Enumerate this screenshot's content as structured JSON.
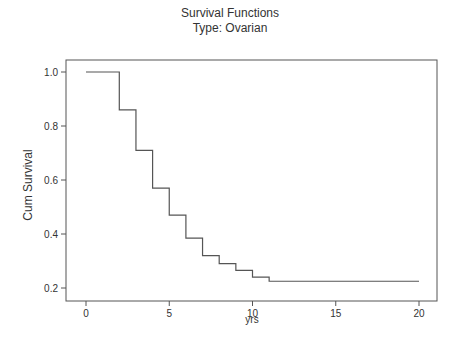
{
  "chart_data": {
    "type": "line",
    "subtype": "step",
    "title": "Survival Functions",
    "subtitle": "Type: Ovarian",
    "xlabel": "yrs",
    "ylabel": "Cum Survival",
    "xlim": [
      -1,
      21
    ],
    "ylim": [
      0.155,
      1.045
    ],
    "xticks": [
      0,
      5,
      10,
      15,
      20
    ],
    "xtick_labels": [
      "0",
      "5",
      "10",
      "15",
      "20"
    ],
    "yticks": [
      0.2,
      0.4,
      0.6,
      0.8,
      1.0
    ],
    "ytick_labels": [
      "0.2",
      "0.4",
      "0.6",
      "0.8",
      "1.0"
    ],
    "grid": false,
    "legend": null,
    "series": [
      {
        "name": "Ovarian",
        "color": "#555555",
        "x": [
          0,
          2,
          3,
          4,
          5,
          6,
          7,
          8,
          9,
          10,
          11,
          20
        ],
        "y": [
          1.0,
          0.86,
          0.71,
          0.57,
          0.47,
          0.385,
          0.32,
          0.29,
          0.265,
          0.24,
          0.225,
          0.225
        ]
      }
    ]
  }
}
